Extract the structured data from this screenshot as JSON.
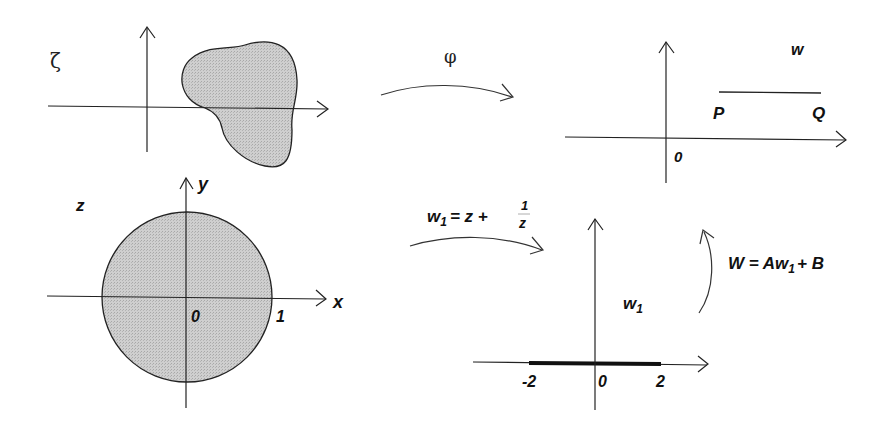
{
  "panels": {
    "zeta_plane": {
      "plane_label": "ζ"
    },
    "phi_map": {
      "label": "φ"
    },
    "w_plane": {
      "plane_label": "w",
      "point_p": "P",
      "point_q": "Q",
      "origin": "0"
    },
    "z_plane": {
      "plane_label": "z",
      "x_axis": "x",
      "y_axis": "y",
      "origin": "0",
      "unit": "1"
    },
    "joukowski_map": {
      "lhs": "w",
      "lhs_sub": "1",
      "rhs": "= z +",
      "frac_num": "1",
      "frac_den": "z"
    },
    "w1_plane": {
      "plane_label": "w",
      "plane_label_sub": "1",
      "tick_neg2": "-2",
      "origin": "0",
      "tick_2": "2"
    },
    "linear_map": {
      "text_a": "W = Aw",
      "sub": "1",
      "text_b": "+ B"
    }
  },
  "colors": {
    "fill": "#c8c8c8",
    "stroke": "#222222"
  }
}
